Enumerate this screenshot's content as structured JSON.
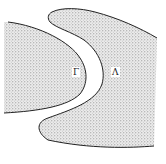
{
  "figure": {
    "type": "region-diagram",
    "colors": {
      "stipple_dot": "#7a7a7a",
      "outline": "#222222",
      "background": "#ffffff"
    },
    "regions": [
      {
        "id": "left-region",
        "label": "Γ"
      },
      {
        "id": "right-region",
        "label": "Λ"
      }
    ]
  }
}
